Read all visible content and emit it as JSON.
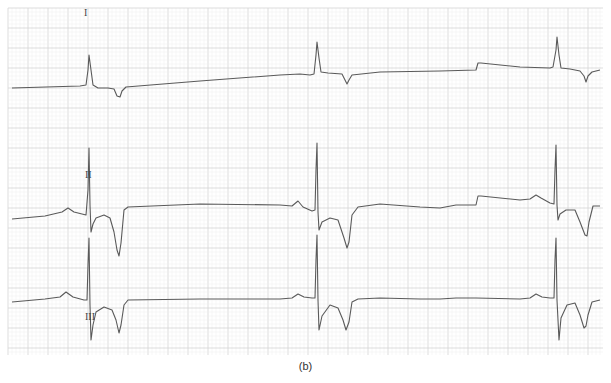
{
  "figure": {
    "caption": "(b)",
    "grid": {
      "x0": 8,
      "y0": 8,
      "x1": 603,
      "y1": 355,
      "minor_px": 4,
      "major_px": 20,
      "minor_color": "#eeeeee",
      "major_color": "#d4d4d4"
    },
    "trace_color": "#5a5a5a"
  },
  "leads": [
    {
      "label": "I",
      "label_pos": [
        84,
        16
      ],
      "path": "M12,88 L80,86 L86,85 L88,70 L89,55 L91,70 L93,85 L98,88 L108,88 L114,89 L117,96 L120,97 L122,91 L126,87 L200,81 L280,75 L300,74 L310,75 L314,74 L316,55 L317,42 L319,58 L321,72 L328,73 L342,74 L345,80 L347,84 L349,80 L352,75 L380,72 L440,71 L476,70 L478,63 L481,63 L520,67 L550,68 L553,67 L556,50 L557,37 L559,55 L561,68 L570,69 L580,71 L584,76 L586,82 L588,76 L592,72 L600,70"
    },
    {
      "label": "II",
      "label_pos": [
        85,
        178
      ],
      "path": "M12,219 L45,216 L62,212 L68,208 L74,212 L82,214 L86,215 L88,190 L89,148 L90,205 L91,232 L93,224 L96,218 L104,215 L110,218 L114,232 L117,250 L119,256 L121,243 L124,210 L128,207 L200,204 L280,205 L292,206 L298,201 L303,207 L312,211 L315,210 L316,170 L317,143 L318,212 L319,230 L322,222 L330,218 L338,220 L344,238 L347,248 L349,242 L352,215 L358,207 L380,204 L420,207 L440,208 L456,205 L476,205 L478,196 L481,196 L520,200 L530,199 L536,195 L541,198 L550,203 L554,204 L555,170 L556,145 L557,205 L558,220 L560,214 L566,210 L575,210 L580,222 L585,235 L587,236 L589,222 L593,206 L600,206"
    },
    {
      "label": "III",
      "label_pos": [
        85,
        320
      ],
      "path": "M12,302 L45,299 L60,297 L66,292 L73,297 L84,300 L87,300 L88,265 L89,238 L90,305 L91,340 L93,325 L96,312 L104,307 L112,310 L116,320 L119,333 L121,325 L124,305 L128,300 L200,299 L280,299 L292,298 L298,294 L304,297 L312,298 L315,298 L316,260 L317,235 L318,300 L319,330 L322,316 L330,305 L338,308 L343,320 L346,330 L349,322 L352,302 L358,299 L380,298 L420,299 L440,299 L456,298 L476,298 L520,299 L530,298 L536,294 L542,297 L550,298 L554,298 L555,260 L556,238 L557,300 L559,340 L561,318 L567,305 L575,303 L580,315 L584,328 L586,326 L588,315 L592,302 L600,300"
    }
  ]
}
